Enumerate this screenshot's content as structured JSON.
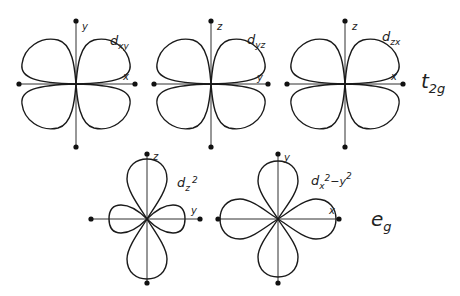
{
  "colors": {
    "line": "#1a1a1a",
    "background": "#ffffff"
  },
  "groups": [
    {
      "label_main": "t",
      "label_sub": "2g",
      "orbitals": [
        "d_xy",
        "d_yz",
        "d_zx"
      ]
    },
    {
      "label_main": "e",
      "label_sub": "g",
      "orbitals": [
        "d_z2",
        "d_x2-y2"
      ]
    }
  ],
  "orbitals": [
    {
      "id": "dxy",
      "name_main": "d",
      "name_sub": "xy",
      "vertical_axis": "y",
      "horizontal_axis": "x",
      "shape": "cloverleaf-between-axes",
      "center": [
        76,
        84
      ]
    },
    {
      "id": "dyz",
      "name_main": "d",
      "name_sub": "yz",
      "vertical_axis": "z",
      "horizontal_axis": "y",
      "shape": "cloverleaf-between-axes",
      "center": [
        213,
        84
      ]
    },
    {
      "id": "dzx",
      "name_main": "d",
      "name_sub": "zx",
      "vertical_axis": "z",
      "horizontal_axis": "x",
      "shape": "cloverleaf-between-axes",
      "center": [
        345,
        84
      ]
    },
    {
      "id": "dz2",
      "name_main": "d",
      "name_sub": "z",
      "name_sup": "2",
      "vertical_axis": "z",
      "horizontal_axis": "y",
      "shape": "dumbbell-with-small-side-lobes",
      "center": [
        147,
        219
      ]
    },
    {
      "id": "dx2y2",
      "name_main": "d",
      "name_sub": "x",
      "name_sup": "2",
      "name_tail": "−y",
      "name_tail_sup": "2",
      "vertical_axis": "y",
      "horizontal_axis": "x",
      "shape": "cloverleaf-on-axes",
      "center": [
        278,
        219
      ]
    }
  ]
}
